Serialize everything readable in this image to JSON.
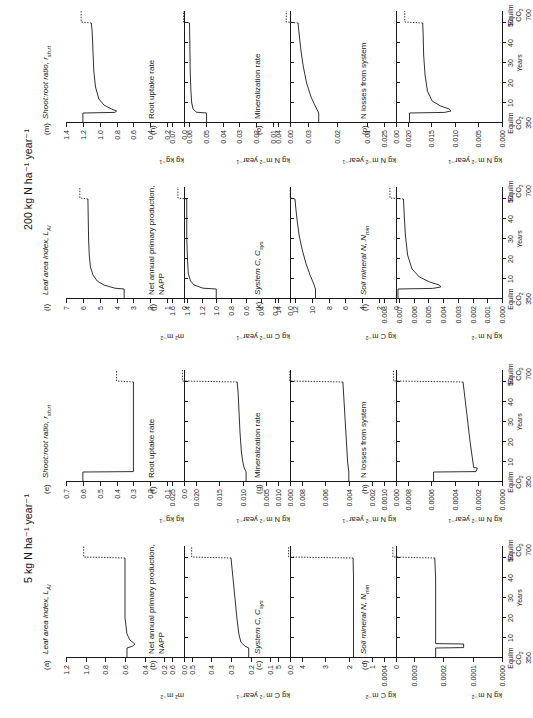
{
  "figure": {
    "blocks": [
      {
        "id": "left",
        "title": "5 kg N ha⁻¹ year⁻¹"
      },
      {
        "id": "right",
        "title": "200 kg N ha⁻¹ year⁻¹"
      }
    ],
    "xaxis": {
      "title": "Years",
      "ticks": [
        "10",
        "20",
        "30",
        "40",
        "50"
      ],
      "left_label": [
        "Equilm",
        "CO₂",
        "350"
      ],
      "right_label": [
        "Equilm",
        "CO₂",
        "700"
      ],
      "range": [
        0,
        56
      ]
    }
  },
  "chart_data": [
    {
      "type": "line",
      "tag": "(a)",
      "title": "Leaf area index, L",
      "title_sub": "AI",
      "ylabel": "m² m⁻²",
      "yticks": [
        "0.0",
        "0.2",
        "0.4",
        "0.6",
        "0.8",
        "1.0",
        "1.2"
      ],
      "ylim": [
        0,
        1.2
      ],
      "x": [
        0,
        5,
        6,
        7,
        9,
        12,
        20,
        30,
        40,
        50,
        50.5,
        53,
        56
      ],
      "y": [
        0.58,
        0.58,
        0.52,
        0.5,
        0.55,
        0.58,
        0.6,
        0.6,
        0.6,
        0.6,
        1.02,
        1.02,
        1.02
      ],
      "dash_from": 50
    },
    {
      "type": "line",
      "tag": "(e)",
      "title": "Shoot:root ratio, r",
      "title_sub": "sh:rt",
      "ylabel": "kg kg⁻¹",
      "yticks": [
        "0.0",
        "0.1",
        "0.2",
        "0.3",
        "0.4",
        "0.5",
        "0.6",
        "0.7"
      ],
      "ylim": [
        0,
        0.7
      ],
      "x": [
        0,
        5,
        5.2,
        20,
        30,
        40,
        50,
        50.5,
        53,
        56
      ],
      "y": [
        0.6,
        0.6,
        0.3,
        0.3,
        0.3,
        0.3,
        0.3,
        0.4,
        0.4,
        0.4
      ],
      "dash_from": 50
    },
    {
      "type": "line",
      "tag": "(b)",
      "title": "Net annual primary production, NAPP",
      "ylabel": "kg C m⁻² year⁻¹",
      "yticks": [
        "0.0",
        "0.1",
        "0.2",
        "0.3",
        "0.4",
        "0.5",
        "0.6"
      ],
      "ylim": [
        0,
        0.6
      ],
      "x": [
        0,
        5,
        6,
        8,
        12,
        20,
        30,
        40,
        50,
        50.5,
        53,
        56
      ],
      "y": [
        0.21,
        0.21,
        0.23,
        0.25,
        0.26,
        0.27,
        0.28,
        0.29,
        0.3,
        0.5,
        0.5,
        0.5
      ],
      "dash_from": 50
    },
    {
      "type": "line",
      "tag": "(f)",
      "title": "Root uptake rate",
      "ylabel": "kg N m⁻² year⁻¹",
      "yticks": [
        "0.000",
        "0.005",
        "0.010",
        "0.015",
        "0.020",
        "0.025"
      ],
      "ylim": [
        0,
        0.025
      ],
      "x": [
        0,
        5,
        7,
        10,
        15,
        25,
        35,
        45,
        50,
        50.5,
        53,
        56
      ],
      "y": [
        0.0093,
        0.0093,
        0.0097,
        0.01,
        0.0103,
        0.0106,
        0.0108,
        0.011,
        0.0112,
        0.0228,
        0.0228,
        0.0228
      ],
      "dash_from": 50
    },
    {
      "type": "line",
      "tag": "(c)",
      "title": "System C, C",
      "title_sub": "sys",
      "ylabel": "kg C m⁻²",
      "yticks": [
        "0",
        "1",
        "2",
        "3",
        "4",
        "5"
      ],
      "ylim": [
        0,
        5
      ],
      "x": [
        0,
        10,
        20,
        30,
        40,
        50,
        50.5,
        53,
        56
      ],
      "y": [
        1.8,
        1.8,
        1.8,
        1.8,
        1.8,
        1.82,
        4.55,
        4.55,
        4.55
      ],
      "dash_from": 50
    },
    {
      "type": "line",
      "tag": "(g)",
      "title": "Mineralization rate",
      "ylabel": "kg N m⁻² year⁻¹",
      "yticks": [
        "0.000",
        "0.002",
        "0.004",
        "0.006",
        "0.008",
        "0.010"
      ],
      "ylim": [
        0,
        0.01
      ],
      "x": [
        0,
        5,
        10,
        20,
        30,
        40,
        50,
        50.5,
        53,
        56
      ],
      "y": [
        0.004,
        0.004,
        0.0041,
        0.0042,
        0.0043,
        0.0044,
        0.0045,
        0.009,
        0.009,
        0.009
      ],
      "dash_from": 50
    },
    {
      "type": "line",
      "tag": "(d)",
      "title": "Soil mineral N, N",
      "title_sub": "min",
      "ylabel": "kg N m⁻²",
      "yticks": [
        "0.0000",
        "0.0001",
        "0.0002",
        "0.0003",
        "0.0004"
      ],
      "ylim": [
        0,
        0.0004
      ],
      "x": [
        0,
        5,
        5.2,
        7,
        7.2,
        20,
        30,
        40,
        50,
        50.5,
        53,
        56
      ],
      "y": [
        0.000225,
        0.000225,
        0.00013,
        0.00013,
        0.000225,
        0.000225,
        0.000225,
        0.000225,
        0.000228,
        0.00037,
        0.00037,
        0.00037
      ],
      "dash_from": 50
    },
    {
      "type": "line",
      "tag": "(h)",
      "title": "N losses from system",
      "ylabel": "kg N m⁻² year⁻¹",
      "yticks": [
        "0.0000",
        "0.0002",
        "0.0004",
        "0.0006",
        "0.0008",
        "0.0010"
      ],
      "ylim": [
        0,
        0.001
      ],
      "x": [
        0,
        5,
        5.2,
        7,
        7.2,
        20,
        30,
        40,
        50,
        50.5,
        53,
        56
      ],
      "y": [
        0.00058,
        0.00058,
        0.00022,
        0.00021,
        0.00024,
        0.00027,
        0.00029,
        0.00031,
        0.00033,
        0.00092,
        0.00092,
        0.00092
      ],
      "dash_from": 50
    },
    {
      "type": "line",
      "tag": "(i)",
      "title": "Leaf area index, L",
      "title_sub": "AI",
      "ylabel": "m² m⁻²",
      "yticks": [
        "0",
        "1",
        "2",
        "3",
        "4",
        "5",
        "6",
        "7"
      ],
      "ylim": [
        0,
        7
      ],
      "x": [
        0,
        5,
        5.4,
        7,
        9,
        12,
        16,
        22,
        30,
        40,
        50,
        50.5,
        53,
        56
      ],
      "y": [
        3.55,
        3.55,
        4.1,
        4.75,
        5.15,
        5.4,
        5.55,
        5.62,
        5.66,
        5.68,
        5.7,
        6.18,
        6.18,
        6.18
      ],
      "dash_from": 50
    },
    {
      "type": "line",
      "tag": "(m)",
      "title": "Shoot:root ratio, r",
      "title_sub": "sh:rt",
      "ylabel": "kg kg⁻¹",
      "yticks": [
        "0.0",
        "0.2",
        "0.4",
        "0.6",
        "0.8",
        "1.0",
        "1.2",
        "1.4"
      ],
      "ylim": [
        0,
        1.4
      ],
      "x": [
        0,
        5,
        5.3,
        6,
        7,
        9,
        12,
        18,
        26,
        36,
        46,
        50,
        50.5,
        53,
        56
      ],
      "y": [
        1.2,
        1.2,
        0.82,
        0.8,
        0.86,
        0.95,
        1.01,
        1.05,
        1.07,
        1.08,
        1.09,
        1.1,
        1.22,
        1.22,
        1.22
      ],
      "dash_from": 50
    },
    {
      "type": "line",
      "tag": "(j)",
      "title": "Net annual primary production, NAPP",
      "ylabel": "kg C m⁻² year⁻¹",
      "yticks": [
        "0.0",
        "0.2",
        "0.4",
        "0.6",
        "0.8",
        "1.0",
        "1.2",
        "1.4",
        "1.6"
      ],
      "ylim": [
        0,
        1.6
      ],
      "x": [
        0,
        5,
        5.4,
        7,
        9,
        13,
        20,
        30,
        40,
        50,
        50.5,
        53,
        56
      ],
      "y": [
        1.0,
        1.0,
        1.18,
        1.3,
        1.35,
        1.38,
        1.39,
        1.4,
        1.4,
        1.4,
        1.52,
        1.52,
        1.52
      ],
      "dash_from": 50
    },
    {
      "type": "line",
      "tag": "(n)",
      "title": "Root uptake rate",
      "ylabel": "kg N m⁻² year⁻¹",
      "yticks": [
        "0.00",
        "0.01",
        "0.02",
        "0.03",
        "0.04",
        "0.05",
        "0.06",
        "0.07"
      ],
      "ylim": [
        0,
        0.07
      ],
      "x": [
        0,
        5,
        5.4,
        7,
        10,
        16,
        26,
        38,
        50,
        50.5,
        53,
        56
      ],
      "y": [
        0.0495,
        0.0495,
        0.0555,
        0.0575,
        0.0583,
        0.0588,
        0.0592,
        0.0594,
        0.0596,
        0.0632,
        0.0632,
        0.0632
      ],
      "dash_from": 50
    },
    {
      "type": "line",
      "tag": "(k)",
      "title": "System C, C",
      "title_sub": "sys",
      "ylabel": "kg C m⁻²",
      "yticks": [
        "0",
        "2",
        "4",
        "6",
        "8",
        "10",
        "12",
        "14"
      ],
      "ylim": [
        0,
        14
      ],
      "x": [
        0,
        5,
        8,
        12,
        18,
        25,
        32,
        40,
        46,
        50,
        50.5,
        53,
        56
      ],
      "y": [
        9.55,
        9.55,
        9.8,
        10.2,
        10.7,
        11.15,
        11.5,
        11.75,
        11.9,
        11.98,
        12.55,
        12.55,
        12.55
      ],
      "dash_from": 50
    },
    {
      "type": "line",
      "tag": "(o)",
      "title": "Mineralization rate",
      "ylabel": "kg N m⁻² year⁻¹",
      "yticks": [
        "0.00",
        "0.01",
        "0.02",
        "0.03",
        "0.04"
      ],
      "ylim": [
        0,
        0.04
      ],
      "x": [
        0,
        5,
        8,
        13,
        20,
        28,
        36,
        44,
        50,
        50.5,
        53,
        56
      ],
      "y": [
        0.0262,
        0.0262,
        0.0272,
        0.0288,
        0.0303,
        0.0314,
        0.0322,
        0.0328,
        0.0332,
        0.0372,
        0.0372,
        0.0372
      ],
      "dash_from": 50
    },
    {
      "type": "line",
      "tag": "(l)",
      "title": "Soil mineral N, N",
      "title_sub": "min",
      "ylabel": "kg N m⁻²",
      "yticks": [
        "0.000",
        "0.001",
        "0.002",
        "0.003",
        "0.004",
        "0.005",
        "0.006",
        "0.007",
        "0.008"
      ],
      "ylim": [
        0,
        0.008
      ],
      "x": [
        0,
        5,
        5.3,
        6,
        7,
        8.5,
        11,
        15,
        22,
        32,
        42,
        50,
        50.5,
        53,
        56
      ],
      "y": [
        0.00705,
        0.00705,
        0.0047,
        0.00415,
        0.00425,
        0.0049,
        0.0056,
        0.0061,
        0.0064,
        0.00655,
        0.00663,
        0.00668,
        0.0076,
        0.0076,
        0.0076
      ],
      "dash_from": 50
    },
    {
      "type": "line",
      "tag": "(p)",
      "title": "N losses from system",
      "ylabel": "kg N m⁻² year⁻¹",
      "yticks": [
        "0.000",
        "0.005",
        "0.010",
        "0.015",
        "0.020",
        "0.025"
      ],
      "ylim": [
        0,
        0.025
      ],
      "x": [
        0,
        5,
        5.3,
        6,
        7,
        8.5,
        11,
        16,
        24,
        34,
        44,
        50,
        50.5,
        53,
        56
      ],
      "y": [
        0.0196,
        0.0196,
        0.0122,
        0.0108,
        0.0112,
        0.013,
        0.0148,
        0.0158,
        0.0163,
        0.0166,
        0.0167,
        0.0168,
        0.0206,
        0.0206,
        0.0206
      ],
      "dash_from": 50
    }
  ]
}
